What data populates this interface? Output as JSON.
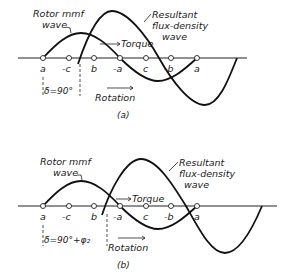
{
  "figure": {
    "panel_a": {
      "caption": "(a)",
      "rotor_label_line1": "Rotor mmf",
      "rotor_label_line2": "wave",
      "flux_label_line1": "Resultant",
      "flux_label_line2": "flux-density",
      "flux_label_line3": "wave",
      "torque_label": "Torque",
      "rotation_label": "Rotation",
      "angle_label": "δ=90°",
      "poles": [
        "a",
        "-c",
        "b",
        "-a",
        "c",
        "-b",
        "a"
      ]
    },
    "panel_b": {
      "caption": "(b)",
      "rotor_label_line1": "Rotor mmf",
      "rotor_label_line2": "wave",
      "flux_label_line1": "Resultant",
      "flux_label_line2": "flux-density",
      "flux_label_line3": "wave",
      "torque_label": "Torque",
      "rotation_label": "Rotation",
      "angle_label": "δ=90°+φ₂",
      "poles": [
        "a",
        "-c",
        "b",
        "-a",
        "c",
        "-b",
        "a"
      ]
    }
  }
}
